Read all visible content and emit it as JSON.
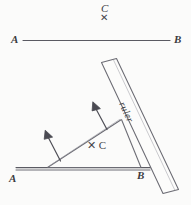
{
  "figure": {
    "background_color": "#fbfbfa",
    "ink_color": "#55555c",
    "label_color": "#3b3b3f"
  },
  "top_panel": {
    "point_label": "C",
    "point_marker": "✕",
    "line": {
      "start_label": "A",
      "end_label": "B"
    }
  },
  "bottom_panel": {
    "line": {
      "start_label": "A",
      "end_label": "B"
    },
    "point_label": "C",
    "point_marker": "✕",
    "point_annotation": "✕ C",
    "ruler_label": "ruler",
    "arrows": [
      {
        "name": "left-perpendicular-arrow"
      },
      {
        "name": "right-perpendicular-arrow"
      }
    ]
  }
}
